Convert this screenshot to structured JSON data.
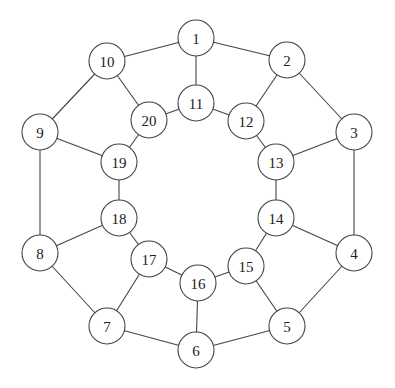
{
  "diagram": {
    "type": "graph",
    "node_radius": 18,
    "colors": {
      "stroke": "#444444",
      "fill": "#ffffff",
      "text": "#222222"
    },
    "nodes": [
      {
        "id": "1",
        "label": "1",
        "x": 196,
        "y": 38
      },
      {
        "id": "2",
        "label": "2",
        "x": 287,
        "y": 60
      },
      {
        "id": "3",
        "label": "3",
        "x": 354,
        "y": 132
      },
      {
        "id": "4",
        "label": "4",
        "x": 354,
        "y": 253
      },
      {
        "id": "5",
        "label": "5",
        "x": 287,
        "y": 326
      },
      {
        "id": "6",
        "label": "6",
        "x": 196,
        "y": 350
      },
      {
        "id": "7",
        "label": "7",
        "x": 107,
        "y": 326
      },
      {
        "id": "8",
        "label": "8",
        "x": 40,
        "y": 253
      },
      {
        "id": "9",
        "label": "9",
        "x": 40,
        "y": 132
      },
      {
        "id": "10",
        "label": "10",
        "x": 107,
        "y": 61
      },
      {
        "id": "11",
        "label": "11",
        "x": 196,
        "y": 103
      },
      {
        "id": "12",
        "label": "12",
        "x": 246,
        "y": 121
      },
      {
        "id": "13",
        "label": "13",
        "x": 276,
        "y": 162
      },
      {
        "id": "14",
        "label": "14",
        "x": 276,
        "y": 218
      },
      {
        "id": "15",
        "label": "15",
        "x": 246,
        "y": 266
      },
      {
        "id": "16",
        "label": "16",
        "x": 198,
        "y": 283
      },
      {
        "id": "17",
        "label": "17",
        "x": 149,
        "y": 259
      },
      {
        "id": "18",
        "label": "18",
        "x": 119,
        "y": 218
      },
      {
        "id": "19",
        "label": "19",
        "x": 119,
        "y": 162
      },
      {
        "id": "20",
        "label": "20",
        "x": 149,
        "y": 120
      }
    ],
    "edges": [
      [
        "1",
        "2"
      ],
      [
        "2",
        "3"
      ],
      [
        "3",
        "4"
      ],
      [
        "4",
        "5"
      ],
      [
        "5",
        "6"
      ],
      [
        "6",
        "7"
      ],
      [
        "7",
        "8"
      ],
      [
        "8",
        "9"
      ],
      [
        "9",
        "10"
      ],
      [
        "10",
        "1"
      ],
      [
        "11",
        "12"
      ],
      [
        "12",
        "13"
      ],
      [
        "13",
        "14"
      ],
      [
        "14",
        "15"
      ],
      [
        "15",
        "16"
      ],
      [
        "16",
        "17"
      ],
      [
        "17",
        "18"
      ],
      [
        "18",
        "19"
      ],
      [
        "19",
        "20"
      ],
      [
        "20",
        "11"
      ],
      [
        "1",
        "11"
      ],
      [
        "2",
        "12"
      ],
      [
        "3",
        "13"
      ],
      [
        "4",
        "14"
      ],
      [
        "5",
        "15"
      ],
      [
        "6",
        "16"
      ],
      [
        "7",
        "17"
      ],
      [
        "8",
        "18"
      ],
      [
        "9",
        "19"
      ],
      [
        "10",
        "20"
      ]
    ]
  }
}
